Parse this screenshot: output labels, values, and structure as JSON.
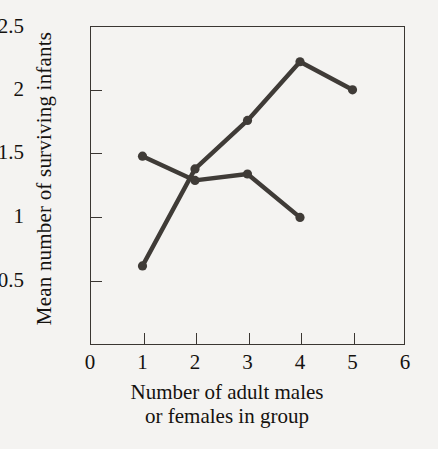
{
  "chart_data": {
    "type": "line",
    "title": "",
    "xlabel": "Number of adult males or females in group",
    "xlabel_line1": "Number of adult males",
    "xlabel_line2": "or females in group",
    "ylabel": "Mean number of surviving infants",
    "xlim": [
      0,
      6
    ],
    "ylim": [
      0,
      2.5
    ],
    "grid": false,
    "legend": "none",
    "xticks": [
      0,
      1,
      2,
      3,
      4,
      5,
      6
    ],
    "xtick_labels": [
      "0",
      "1",
      "2",
      "3",
      "4",
      "5",
      "6"
    ],
    "yticks": [
      0,
      0.5,
      1,
      1.5,
      2,
      2.5
    ],
    "ytick_labels": [
      "0",
      "0.5",
      "1",
      "1.5",
      "2",
      "2.5"
    ],
    "marker": "filled-circle",
    "line_color": "#3f3b37",
    "series": [
      {
        "name": "adult males",
        "x": [
          1,
          2,
          3,
          4,
          5
        ],
        "values": [
          0.62,
          1.38,
          1.76,
          2.22,
          2.0
        ]
      },
      {
        "name": "adult females",
        "x": [
          1,
          2,
          3,
          4
        ],
        "values": [
          1.48,
          1.29,
          1.34,
          1.0
        ]
      }
    ]
  },
  "axes": {
    "y_title": "Mean number of surviving infants",
    "x_title_line1": "Number of adult males",
    "x_title_line2": "or females in group",
    "y_labels": [
      "2.5",
      "2",
      "1.5",
      "1",
      "0.5",
      "0"
    ],
    "x_labels": [
      "0",
      "1",
      "2",
      "3",
      "4",
      "5",
      "6"
    ]
  },
  "colors": {
    "background": "#f4f3f1",
    "axis": "#3a3632",
    "series": "#3f3b37",
    "text": "#15120f"
  }
}
